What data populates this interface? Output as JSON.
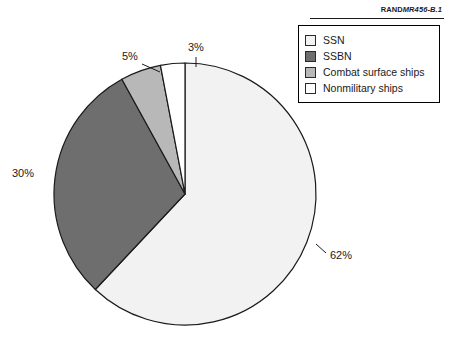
{
  "credit": {
    "brand": "RAND",
    "document_id": "MR456-B.1"
  },
  "legend": {
    "items": [
      {
        "label": "SSN",
        "color": "#f2f2f2"
      },
      {
        "label": "SSBN",
        "color": "#6e6e6e"
      },
      {
        "label": "Combat surface ships",
        "color": "#b8b8b8"
      },
      {
        "label": "Nonmilitary ships",
        "color": "#ffffff"
      }
    ]
  },
  "chart_data": {
    "type": "pie",
    "title": "",
    "categories": [
      "SSN",
      "SSBN",
      "Combat surface ships",
      "Nonmilitary ships"
    ],
    "values": [
      62,
      30,
      5,
      3
    ],
    "labels": [
      "62%",
      "30%",
      "5%",
      "3%"
    ],
    "colors": [
      "#f2f2f2",
      "#6e6e6e",
      "#b8b8b8",
      "#ffffff"
    ],
    "units": "percent",
    "start_angle_deg": 0,
    "direction": "clockwise",
    "legend_position": "top-right",
    "grid": false,
    "xlabel": "",
    "ylabel": ""
  }
}
